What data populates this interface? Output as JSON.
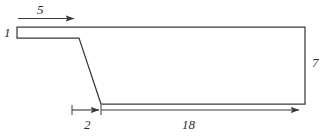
{
  "figure": {
    "type": "engineering-dimension-diagram",
    "background_color": "#ffffff",
    "line_color": "#3a3a3a",
    "text_color": "#2b2b2b",
    "canvas": {
      "width": 330,
      "height": 139
    }
  },
  "dimensions": [
    {
      "id": "top-left-run",
      "label": "5",
      "orientation": "horizontal",
      "arrow": "right",
      "position": "above-top-edge"
    },
    {
      "id": "left-thickness",
      "label": "1",
      "orientation": "vertical",
      "arrow": "none",
      "position": "left-edge"
    },
    {
      "id": "right-height",
      "label": "7",
      "orientation": "vertical",
      "arrow": "none",
      "position": "right-of-right-edge"
    },
    {
      "id": "slope-run",
      "label": "2",
      "orientation": "horizontal",
      "arrow": "right",
      "position": "below-bottom-edge"
    },
    {
      "id": "bottom-run",
      "label": "18",
      "orientation": "horizontal",
      "arrow": "right",
      "position": "below-bottom-edge"
    }
  ],
  "outline": {
    "description": "Closed polygon: thin left strip stepping down a diagonal to a tall right body",
    "points": "17,27 305,27 305,104 101,104 79,38 17,38"
  }
}
